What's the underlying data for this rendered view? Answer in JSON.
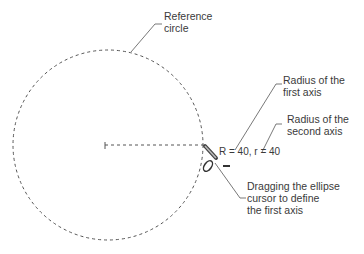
{
  "labels": {
    "reference_circle": "Reference\ncircle",
    "radius_first": "Radius of the\nfirst axis",
    "radius_second": "Radius of the\nsecond axis",
    "readout": "R = 40, r = 40",
    "dragging": "Dragging the ellipse\ncursor to define\nthe first axis"
  },
  "colors": {
    "line": "#555555",
    "text": "#3a3a3a"
  }
}
